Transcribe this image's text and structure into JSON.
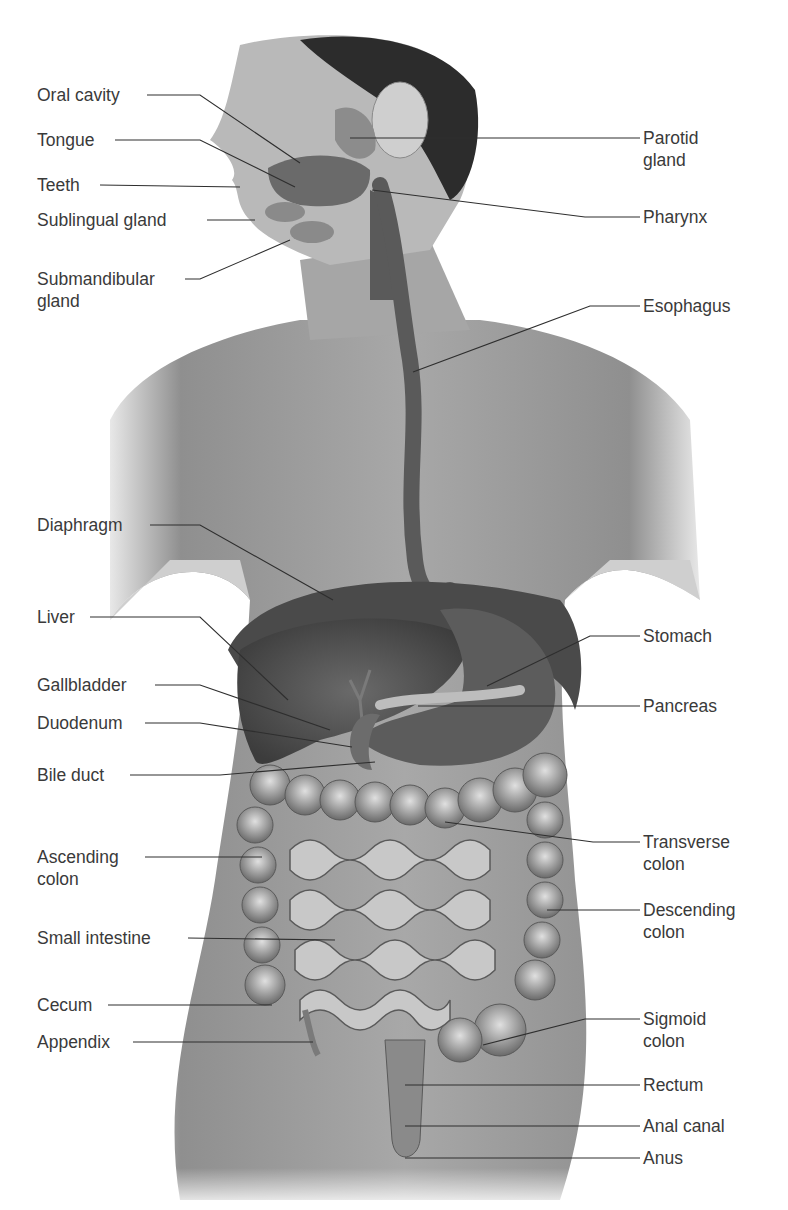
{
  "figure": {
    "type": "labeled anatomical illustration",
    "top_caption_partially_visible": true
  },
  "labels_left": [
    {
      "id": "oral-cavity",
      "text": "Oral cavity",
      "line2": "",
      "x": 37,
      "y": 84
    },
    {
      "id": "tongue",
      "text": "Tongue",
      "line2": "",
      "x": 37,
      "y": 129
    },
    {
      "id": "teeth",
      "text": "Teeth",
      "line2": "",
      "x": 37,
      "y": 174
    },
    {
      "id": "sublingual-gland",
      "text": "Sublingual gland",
      "line2": "",
      "x": 37,
      "y": 209
    },
    {
      "id": "submandibular-gland",
      "text": "Submandibular",
      "line2": "gland",
      "x": 37,
      "y": 268
    },
    {
      "id": "diaphragm",
      "text": "Diaphragm",
      "line2": "",
      "x": 37,
      "y": 514
    },
    {
      "id": "liver",
      "text": "Liver",
      "line2": "",
      "x": 37,
      "y": 606
    },
    {
      "id": "gallbladder",
      "text": "Gallbladder",
      "line2": "",
      "x": 37,
      "y": 674
    },
    {
      "id": "duodenum",
      "text": "Duodenum",
      "line2": "",
      "x": 37,
      "y": 712
    },
    {
      "id": "bile-duct",
      "text": "Bile duct",
      "line2": "",
      "x": 37,
      "y": 764
    },
    {
      "id": "ascending-colon",
      "text": "Ascending",
      "line2": "colon",
      "x": 37,
      "y": 846
    },
    {
      "id": "small-intestine",
      "text": "Small intestine",
      "line2": "",
      "x": 37,
      "y": 927
    },
    {
      "id": "cecum",
      "text": "Cecum",
      "line2": "",
      "x": 37,
      "y": 994
    },
    {
      "id": "appendix",
      "text": "Appendix",
      "line2": "",
      "x": 37,
      "y": 1031
    }
  ],
  "labels_right": [
    {
      "id": "parotid-gland",
      "text": "Parotid",
      "line2": "gland",
      "x": 643,
      "y": 127
    },
    {
      "id": "pharynx",
      "text": "Pharynx",
      "line2": "",
      "x": 643,
      "y": 206
    },
    {
      "id": "esophagus",
      "text": "Esophagus",
      "line2": "",
      "x": 643,
      "y": 295
    },
    {
      "id": "stomach",
      "text": "Stomach",
      "line2": "",
      "x": 643,
      "y": 625
    },
    {
      "id": "pancreas",
      "text": "Pancreas",
      "line2": "",
      "x": 643,
      "y": 695
    },
    {
      "id": "transverse-colon",
      "text": "Transverse",
      "line2": "colon",
      "x": 643,
      "y": 831
    },
    {
      "id": "descending-colon",
      "text": "Descending",
      "line2": "colon",
      "x": 643,
      "y": 899
    },
    {
      "id": "sigmoid-colon",
      "text": "Sigmoid",
      "line2": "colon",
      "x": 643,
      "y": 1008
    },
    {
      "id": "rectum",
      "text": "Rectum",
      "line2": "",
      "x": 643,
      "y": 1074
    },
    {
      "id": "anal-canal",
      "text": "Anal canal",
      "line2": "",
      "x": 643,
      "y": 1115
    },
    {
      "id": "anus",
      "text": "Anus",
      "line2": "",
      "x": 643,
      "y": 1147
    }
  ],
  "leader_lines": {
    "oral-cavity": "147,95 200,95 300,163",
    "tongue": "115,140 200,140 295,187",
    "teeth": "100,185 240,187",
    "sublingual-gland": "207,220 255,220",
    "submandibular-gland": "185,279 200,279 290,240",
    "parotid-gland": "640,138 350,138",
    "pharynx": "640,217 585,217 372,190",
    "esophagus": "640,306 590,306 413,372",
    "diaphragm": "150,525 200,525 333,600",
    "liver": "90,617 200,617 288,700",
    "gallbladder": "155,685 200,685 330,730",
    "duodenum": "145,723 200,723 352,747",
    "bile-duct": "130,775 220,775 375,762",
    "stomach": "640,636 590,636 487,686",
    "pancreas": "640,706 418,706",
    "transverse-colon": "640,842 593,842 445,822",
    "descending-colon": "640,910 547,910",
    "ascending-colon": "145,857 262,857",
    "small-intestine": "188,938 335,940",
    "cecum": "108,1005 272,1005",
    "appendix": "133,1042 313,1042",
    "sigmoid-colon": "640,1019 585,1019 483,1045",
    "rectum": "640,1085 405,1085",
    "anal-canal": "640,1126 405,1126",
    "anus": "640,1158 405,1158"
  },
  "colors": {
    "background": "#ffffff",
    "label_text": "#3a3a3a",
    "leader_line": "#2e2e2e",
    "skin": "#9a9a9a",
    "skin_light": "#c4c4c4",
    "hair": "#2a2a2a",
    "organ_dark": "#4a4a4a",
    "organ_mid": "#6e6e6e",
    "intestine": "#b8b8b8"
  }
}
